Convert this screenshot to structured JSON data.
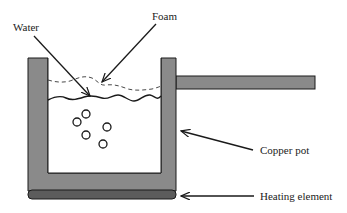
{
  "diagram": {
    "labels": {
      "water": "Water",
      "foam": "Foam",
      "copper_pot": "Copper pot",
      "heating_element": "Heating element"
    },
    "colors": {
      "pot_fill": "#8a8a8a",
      "heating_fill": "#5c5c5c",
      "outline": "#1a1a1a",
      "background": "#ffffff"
    },
    "bubbles": [
      {
        "cx": 86,
        "cy": 114,
        "r": 4
      },
      {
        "cx": 77,
        "cy": 122,
        "r": 4
      },
      {
        "cx": 107,
        "cy": 127,
        "r": 4
      },
      {
        "cx": 86,
        "cy": 135,
        "r": 4
      },
      {
        "cx": 103,
        "cy": 144,
        "r": 4
      }
    ]
  }
}
